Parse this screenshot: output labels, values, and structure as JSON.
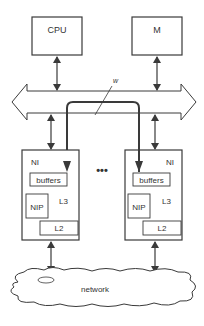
{
  "diagram": {
    "nodes": {
      "cpu": {
        "label": "CPU"
      },
      "memory": {
        "label": "M"
      },
      "ni_left": {
        "label": "NI",
        "buffers": "buffers",
        "nip": "NIP",
        "l3": "L3",
        "l2": "L2"
      },
      "ni_right": {
        "label": "NI",
        "buffers": "buffers",
        "nip": "NIP",
        "l3": "L3",
        "l2": "L2"
      },
      "network": {
        "label": "network"
      }
    },
    "bus": {
      "label": ""
    },
    "path_label": "w",
    "ellipsis": "•••",
    "colors": {
      "stroke": "#3a3a3a",
      "fill": "#ffffff",
      "text": "#333333"
    }
  }
}
